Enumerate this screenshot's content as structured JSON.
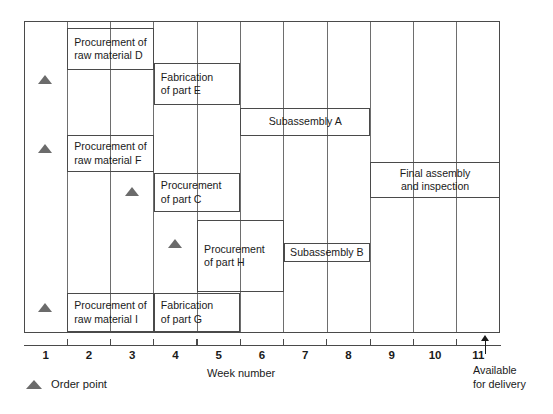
{
  "chart_data": {
    "type": "bar",
    "title": "",
    "xlabel": "Week number",
    "ylabel": "",
    "xlim": [
      1,
      12
    ],
    "grid": true,
    "legend_position": "bottom-left",
    "x_tick_labels": [
      "1",
      "2",
      "3",
      "4",
      "5",
      "6",
      "7",
      "8",
      "9",
      "10",
      "11"
    ],
    "gridline_weeks": [
      2,
      3,
      4,
      5,
      6,
      7,
      8,
      9,
      10,
      11
    ],
    "tasks": [
      {
        "id": "proc-raw-material-d",
        "label_lines": [
          "Procurement of",
          "raw material D"
        ],
        "start_week": 2,
        "end_week": 4,
        "row_top": 28,
        "row_bottom": 70,
        "label_align": "left",
        "order_point_week": 1.5,
        "order_point_y": 84
      },
      {
        "id": "fabrication-part-e",
        "label_lines": [
          "Fabrication",
          "of part E"
        ],
        "start_week": 4,
        "end_week": 6,
        "row_top": 63,
        "row_bottom": 105,
        "label_align": "left",
        "order_point_week": null,
        "order_point_y": null
      },
      {
        "id": "subassembly-a",
        "label_lines": [
          "Subassembly A"
        ],
        "start_week": 6,
        "end_week": 9,
        "row_top": 108,
        "row_bottom": 136,
        "label_align": "center",
        "order_point_week": null,
        "order_point_y": null
      },
      {
        "id": "proc-raw-material-f",
        "label_lines": [
          "Procurement of",
          "raw material F"
        ],
        "start_week": 2,
        "end_week": 4,
        "row_top": 135,
        "row_bottom": 172,
        "label_align": "left",
        "order_point_week": 1.5,
        "order_point_y": 153
      },
      {
        "id": "proc-part-c",
        "label_lines": [
          "Procurement",
          "of part C"
        ],
        "start_week": 4,
        "end_week": 6,
        "row_top": 173,
        "row_bottom": 212,
        "label_align": "left",
        "order_point_week": 3.5,
        "order_point_y": 196
      },
      {
        "id": "final-assembly-and-inspection",
        "label_lines": [
          "Final assembly",
          "and inspection"
        ],
        "start_week": 9,
        "end_week": 12,
        "row_top": 162,
        "row_bottom": 198,
        "label_align": "center",
        "order_point_week": null,
        "order_point_y": null
      },
      {
        "id": "proc-part-h",
        "label_lines": [
          "Procurement",
          "of part H"
        ],
        "start_week": 5,
        "end_week": 7,
        "row_top": 220,
        "row_bottom": 292,
        "label_align": "left",
        "order_point_week": 4.5,
        "order_point_y": 248
      },
      {
        "id": "subassembly-b",
        "label_lines": [
          "Subassembly B"
        ],
        "start_week": 7,
        "end_week": 9,
        "row_top": 243,
        "row_bottom": 262,
        "label_align": "center",
        "order_point_week": null,
        "order_point_y": null
      },
      {
        "id": "proc-raw-material-i",
        "label_lines": [
          "Procurement of",
          "raw material I"
        ],
        "start_week": 2,
        "end_week": 4,
        "row_top": 293,
        "row_bottom": 332,
        "label_align": "left",
        "order_point_week": 1.5,
        "order_point_y": 312
      },
      {
        "id": "fabrication-part-g",
        "label_lines": [
          "Fabrication",
          "of part G"
        ],
        "start_week": 4,
        "end_week": 6,
        "row_top": 293,
        "row_bottom": 332,
        "label_align": "left",
        "order_point_week": null,
        "order_point_y": null
      }
    ],
    "annotations": {
      "delivery_marker_week": 11.65,
      "delivery_label_lines": [
        "Available",
        "for delivery"
      ]
    },
    "legend": [
      {
        "symbol": "triangle-marker",
        "label": "Order point",
        "color": "#6b6b6b"
      }
    ],
    "colors": {
      "bar_border": "#4a4a4a",
      "gridline": "#6e6e6e",
      "marker": "#6b6b6b",
      "text": "#1a1a1a",
      "background": "#ffffff"
    }
  }
}
